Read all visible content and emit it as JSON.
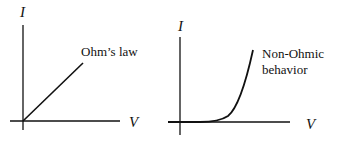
{
  "diagram": {
    "left_graph": {
      "y_axis_label": "I",
      "x_axis_label": "V",
      "annotation": "Ohm’s law",
      "curve": "linear"
    },
    "right_graph": {
      "y_axis_label": "I",
      "x_axis_label": "V",
      "annotation_line1": "Non-Ohmic",
      "annotation_line2": "behavior",
      "curve": "exponential"
    },
    "colors": {
      "stroke": "#111111",
      "background": "#ffffff"
    }
  }
}
